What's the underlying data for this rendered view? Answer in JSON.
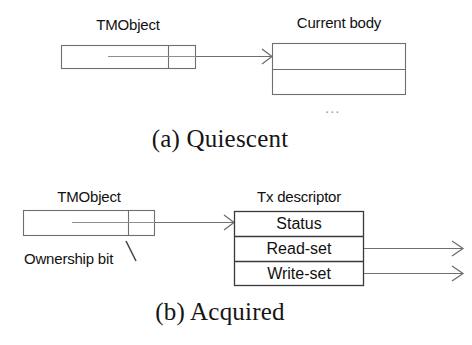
{
  "figure": {
    "type": "two-panel-diagram",
    "panels": [
      {
        "id": "panel-a",
        "caption": "(a) Quiescent",
        "labels": {
          "tmobject": "TMObject",
          "body": "Current body",
          "ellipsis": "..."
        },
        "boxes": [
          {
            "name": "tmobject-box",
            "cells": [
              "",
              ""
            ]
          },
          {
            "name": "current-body-box",
            "cells": [
              "",
              ""
            ]
          }
        ],
        "arrows": [
          {
            "name": "tmobject-to-body-arrow",
            "from": "tmobject-box",
            "to": "current-body-box"
          }
        ]
      },
      {
        "id": "panel-b",
        "caption": "(b) Acquired",
        "labels": {
          "tmobject": "TMObject",
          "descriptor": "Tx descriptor",
          "ownership": "Ownership bit"
        },
        "boxes": [
          {
            "name": "tmobject-box",
            "cells": [
              "",
              ""
            ]
          },
          {
            "name": "tx-descriptor-box",
            "cells": [
              "Status",
              "Read-set",
              "Write-set"
            ]
          }
        ],
        "arrows": [
          {
            "name": "tmobject-to-descriptor-arrow",
            "from": "tmobject-box",
            "to": "tx-descriptor-box"
          },
          {
            "name": "read-set-arrow",
            "from": "Read-set",
            "to": ""
          },
          {
            "name": "write-set-arrow",
            "from": "Write-set",
            "to": ""
          }
        ]
      }
    ],
    "rows": {
      "status": "Status",
      "read_set": "Read-set",
      "write_set": "Write-set"
    },
    "colors": {
      "stroke": "#6f6f6f",
      "stroke_dark": "#2a2a2a",
      "text": "#111111",
      "background": "#ffffff",
      "muted": "#9a9a9a"
    }
  }
}
